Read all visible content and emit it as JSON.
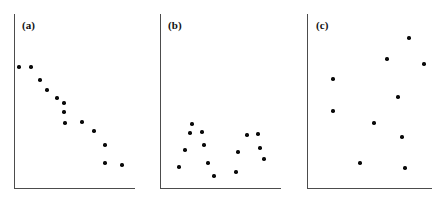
{
  "figure": {
    "width": 441,
    "height": 205,
    "background_color": "#ffffff",
    "axis_color": "#4c4c4c",
    "point_color": "#0a0a0a",
    "panel_count": 3
  },
  "panels": [
    {
      "label": "(a)",
      "label_x": 22,
      "label_y": 20,
      "axis_x_left": 14,
      "axis_x_right": 135,
      "axis_y_top": 14,
      "axis_y_bottom": 188
    },
    {
      "label": "(b)",
      "label_x": 168,
      "label_y": 20,
      "axis_x_left": 160,
      "axis_x_right": 281,
      "axis_y_top": 14,
      "axis_y_bottom": 188
    },
    {
      "label": "(c)",
      "label_x": 316,
      "label_y": 20,
      "axis_x_left": 307,
      "axis_x_right": 432,
      "axis_y_top": 14,
      "axis_y_bottom": 188
    }
  ],
  "chart_data": [
    {
      "type": "scatter",
      "title": "(a)",
      "xlabel": "",
      "ylabel": "",
      "grid": false,
      "legend": false,
      "axis_ticks": false,
      "relationship": "strong negative linear association",
      "xlim": [
        14,
        135
      ],
      "ylim": [
        14,
        188
      ],
      "n_points": 15,
      "points": [
        {
          "x": 19,
          "y": 67
        },
        {
          "x": 31,
          "y": 67
        },
        {
          "x": 40,
          "y": 80
        },
        {
          "x": 47,
          "y": 90
        },
        {
          "x": 57,
          "y": 98
        },
        {
          "x": 64,
          "y": 103
        },
        {
          "x": 64,
          "y": 112
        },
        {
          "x": 65,
          "y": 123
        },
        {
          "x": 82,
          "y": 122
        },
        {
          "x": 94,
          "y": 131
        },
        {
          "x": 105,
          "y": 145
        },
        {
          "x": 105,
          "y": 163
        },
        {
          "x": 122,
          "y": 165
        }
      ]
    },
    {
      "type": "scatter",
      "title": "(b)",
      "xlabel": "",
      "ylabel": "",
      "grid": false,
      "legend": false,
      "axis_ticks": false,
      "relationship": "curvilinear U-shaped association",
      "xlim": [
        160,
        281
      ],
      "ylim": [
        14,
        188
      ],
      "n_points": 14,
      "points": [
        {
          "x": 192,
          "y": 124
        },
        {
          "x": 190,
          "y": 133
        },
        {
          "x": 202,
          "y": 132
        },
        {
          "x": 185,
          "y": 150
        },
        {
          "x": 204,
          "y": 145
        },
        {
          "x": 179,
          "y": 167
        },
        {
          "x": 208,
          "y": 163
        },
        {
          "x": 214,
          "y": 176
        },
        {
          "x": 236,
          "y": 172
        },
        {
          "x": 238,
          "y": 152
        },
        {
          "x": 247,
          "y": 135
        },
        {
          "x": 258,
          "y": 134
        },
        {
          "x": 260,
          "y": 148
        },
        {
          "x": 264,
          "y": 159
        }
      ]
    },
    {
      "type": "scatter",
      "title": "(c)",
      "xlabel": "",
      "ylabel": "",
      "grid": false,
      "legend": false,
      "axis_ticks": false,
      "relationship": "no association / random scatter",
      "xlim": [
        307,
        432
      ],
      "ylim": [
        14,
        188
      ],
      "n_points": 10,
      "points": [
        {
          "x": 409,
          "y": 38
        },
        {
          "x": 387,
          "y": 59
        },
        {
          "x": 424,
          "y": 64
        },
        {
          "x": 333,
          "y": 79
        },
        {
          "x": 398,
          "y": 97
        },
        {
          "x": 333,
          "y": 111
        },
        {
          "x": 374,
          "y": 123
        },
        {
          "x": 402,
          "y": 137
        },
        {
          "x": 360,
          "y": 163
        },
        {
          "x": 405,
          "y": 168
        }
      ]
    }
  ]
}
